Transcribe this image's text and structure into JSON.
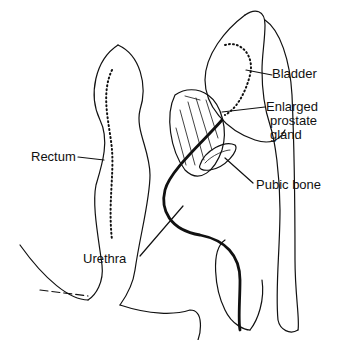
{
  "diagram": {
    "labels": {
      "bladder": "Bladder",
      "enlarged_prostate_line1": "Enlarged",
      "enlarged_prostate_line2": "prostate",
      "enlarged_prostate_line3": "gland",
      "rectum": "Rectum",
      "pubic_bone": "Pubic bone",
      "urethra": "Urethra"
    },
    "colors": {
      "ink": "#111111",
      "background": "#ffffff"
    }
  }
}
